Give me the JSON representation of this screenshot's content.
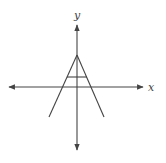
{
  "diagram": {
    "axes": {
      "x_label": "x",
      "y_label": "y",
      "origin": [
        77,
        87
      ],
      "x_range_px": [
        9,
        143
      ],
      "y_range_px": [
        25,
        150
      ]
    },
    "shape": {
      "description": "A-shaped graph: two lines meeting at apex on y-axis with horizontal crossbar",
      "apex": [
        77,
        55
      ],
      "left_end": [
        49,
        117
      ],
      "right_end": [
        104,
        117
      ],
      "crossbar": {
        "y": 77,
        "x_from": 67,
        "x_to": 87
      }
    },
    "colors": {
      "stroke": "#444444",
      "background": "#ffffff"
    }
  }
}
